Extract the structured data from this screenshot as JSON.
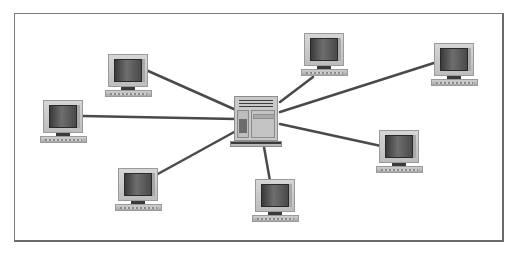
{
  "diagram": {
    "type": "star-network-topology",
    "colors": {
      "frame_border": "#7a7a7a",
      "link": "#4a4a4a",
      "background": "#ffffff"
    },
    "hub": {
      "name": "server",
      "icon": "server-icon",
      "x": 230,
      "y": 96
    },
    "nodes": [
      {
        "name": "workstation-top-left",
        "icon": "computer-icon",
        "x": 105,
        "y": 54,
        "link_from": [
          236,
          110
        ],
        "link_to": [
          146,
          70
        ]
      },
      {
        "name": "workstation-top-center",
        "icon": "computer-icon",
        "x": 301,
        "y": 33,
        "link_from": [
          280,
          102
        ],
        "link_to": [
          313,
          77
        ]
      },
      {
        "name": "workstation-top-right",
        "icon": "computer-icon",
        "x": 431,
        "y": 43,
        "link_from": [
          280,
          112
        ],
        "link_to": [
          437,
          62
        ]
      },
      {
        "name": "workstation-left",
        "icon": "computer-icon",
        "x": 40,
        "y": 100,
        "link_from": [
          236,
          119
        ],
        "link_to": [
          83,
          116
        ]
      },
      {
        "name": "workstation-right",
        "icon": "computer-icon",
        "x": 376,
        "y": 130,
        "link_from": [
          280,
          124
        ],
        "link_to": [
          381,
          146
        ]
      },
      {
        "name": "workstation-bottom-left",
        "icon": "computer-icon",
        "x": 115,
        "y": 168,
        "link_from": [
          236,
          131
        ],
        "link_to": [
          156,
          175
        ]
      },
      {
        "name": "workstation-bottom-center",
        "icon": "computer-icon",
        "x": 252,
        "y": 179,
        "link_from": [
          264,
          147
        ],
        "link_to": [
          270,
          181
        ]
      }
    ]
  }
}
